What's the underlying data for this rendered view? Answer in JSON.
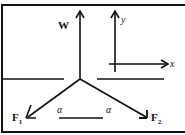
{
  "diagram": {
    "type": "free-body force diagram",
    "colors": {
      "ink": "#111111",
      "background": "#ffffff"
    },
    "forces": [
      {
        "label": "W",
        "direction": "up"
      },
      {
        "label": "F",
        "subscript": "1",
        "direction": "down-left"
      },
      {
        "label": "F",
        "subscript": "2",
        "direction": "down-right"
      }
    ],
    "axes": {
      "x_label": "x",
      "y_label": "y"
    },
    "angles": [
      {
        "symbol": "α"
      },
      {
        "symbol": "α"
      }
    ]
  }
}
